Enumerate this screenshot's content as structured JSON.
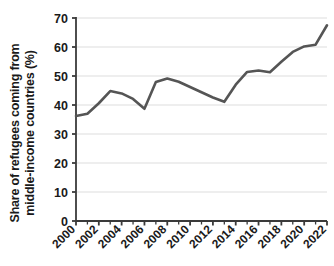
{
  "chart_data": {
    "type": "line",
    "title": "",
    "xlabel": "",
    "ylabel": "Share of refugees coming from middle-income countries (%)",
    "ylabel_lines": [
      "Share of refugees coming from",
      "middle-income countries (%)"
    ],
    "xlim": [
      2000,
      2022
    ],
    "ylim": [
      0,
      70
    ],
    "y_ticks": [
      0,
      10,
      20,
      30,
      40,
      50,
      60,
      70
    ],
    "x_ticks": [
      2000,
      2002,
      2004,
      2006,
      2008,
      2010,
      2012,
      2014,
      2016,
      2018,
      2020,
      2022
    ],
    "x_minor_ticks": [
      2001,
      2003,
      2005,
      2007,
      2009,
      2011,
      2013,
      2015,
      2017,
      2019,
      2021
    ],
    "x": [
      2000,
      2001,
      2002,
      2003,
      2004,
      2005,
      2006,
      2007,
      2008,
      2009,
      2010,
      2011,
      2012,
      2013,
      2014,
      2015,
      2016,
      2017,
      2018,
      2019,
      2020,
      2021,
      2022
    ],
    "values": [
      36.2,
      37.0,
      40.6,
      44.8,
      44.0,
      42.1,
      38.7,
      47.9,
      49.1,
      48.0,
      46.2,
      44.4,
      42.6,
      41.1,
      47.0,
      51.4,
      51.9,
      51.3,
      54.9,
      58.3,
      60.2,
      60.8,
      67.5
    ],
    "series": [
      {
        "name": "Share of refugees coming from middle-income countries (%)",
        "values": [
          36.2,
          37.0,
          40.6,
          44.8,
          44.0,
          42.1,
          38.7,
          47.9,
          49.1,
          48.0,
          46.2,
          44.4,
          42.6,
          41.1,
          47.0,
          51.4,
          51.9,
          51.3,
          54.9,
          58.3,
          60.2,
          60.8,
          67.5
        ],
        "color": "#555555"
      }
    ],
    "grid": true,
    "grid_axis": "y",
    "legend": false,
    "legend_position": "none",
    "colors": {
      "line": "#555555",
      "grid": "#e8e8e8",
      "axis": "#3a3a3a",
      "text": "#1a1a1a",
      "background": "#ffffff"
    }
  }
}
